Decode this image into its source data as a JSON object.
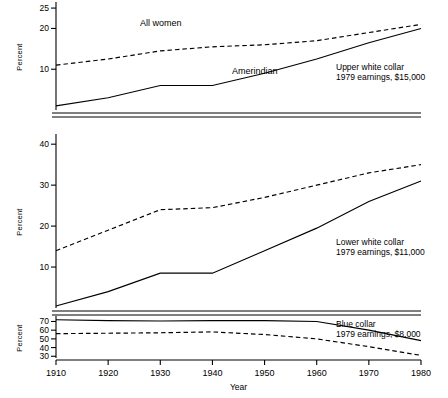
{
  "chart_data": {
    "type": "line",
    "title": "",
    "xlabel": "Year",
    "ylabel": "Percent",
    "grid": false,
    "legend_position": "inline-annotation",
    "x": [
      1910,
      1920,
      1930,
      1940,
      1950,
      1960,
      1970,
      1980
    ],
    "xtick_labels": [
      "1910",
      "1920",
      "1930",
      "1940",
      "1950",
      "1960",
      "1970",
      "1980"
    ],
    "xlim": [
      1910,
      1980
    ],
    "panels": [
      {
        "name": "upper-white-collar",
        "annotation_line1": "Upper white collar",
        "annotation_line2": "1979 earnings, $15,000",
        "ylim": [
          0,
          26
        ],
        "ytick_labels": [
          "25",
          "20",
          "10"
        ],
        "yticks": [
          25,
          20,
          10
        ],
        "series": [
          {
            "name": "All women",
            "style": "dashed",
            "label": "All women",
            "values": [
              11.0,
              12.5,
              14.5,
              15.5,
              16.0,
              17.0,
              19.0,
              21.0
            ]
          },
          {
            "name": "Amerindian",
            "style": "solid",
            "label": "Amerindian",
            "values": [
              1.0,
              3.0,
              6.0,
              6.0,
              9.0,
              12.5,
              16.5,
              20.0
            ]
          }
        ]
      },
      {
        "name": "lower-white-collar",
        "annotation_line1": "Lower white collar",
        "annotation_line2": "1979 earnings, $11,000",
        "ylim": [
          0,
          42
        ],
        "ytick_labels": [
          "40",
          "30",
          "20",
          "10"
        ],
        "yticks": [
          40,
          30,
          20,
          10
        ],
        "series": [
          {
            "name": "All women",
            "style": "dashed",
            "label": "",
            "values": [
              14.0,
              19.0,
              24.0,
              24.5,
              27.0,
              30.0,
              33.0,
              35.0
            ]
          },
          {
            "name": "Amerindian",
            "style": "solid",
            "label": "",
            "values": [
              0.5,
              4.0,
              8.5,
              8.5,
              14.0,
              19.5,
              26.0,
              31.0
            ]
          }
        ]
      },
      {
        "name": "blue-collar",
        "annotation_line1": "Blue collar",
        "annotation_line2": "1979 earnings, $8,000",
        "ylim": [
          28,
          74
        ],
        "ytick_labels": [
          "70",
          "60",
          "50",
          "40",
          "30"
        ],
        "yticks": [
          70,
          60,
          50,
          40,
          30
        ],
        "series": [
          {
            "name": "All women",
            "style": "dashed",
            "label": "",
            "values": [
              56.0,
              56.5,
              57.0,
              58.0,
              55.0,
              50.0,
              41.0,
              31.0
            ]
          },
          {
            "name": "Amerindian",
            "style": "solid",
            "label": "",
            "values": [
              72.0,
              71.0,
              70.5,
              71.0,
              71.0,
              70.0,
              60.0,
              48.0
            ]
          }
        ]
      }
    ]
  }
}
